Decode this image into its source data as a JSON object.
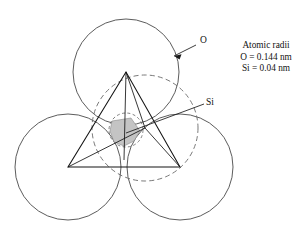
{
  "figure": {
    "name": "silicate-tetrahedron",
    "background_color": "#ffffff",
    "width": 308,
    "height": 231
  },
  "labels": {
    "oxygen": {
      "text": "O",
      "x": 200,
      "y": 43
    },
    "silicon": {
      "text": "Si",
      "x": 206,
      "y": 105
    }
  },
  "annotation": {
    "title": "Atomic radii",
    "oxygen_radius": "O = 0.144 nm",
    "silicon_radius": "Si = 0.04 nm"
  },
  "colors": {
    "sphere_stroke": "#4a4a4a",
    "hidden_sphere_stroke": "#6a6a6a",
    "edge_stroke": "#141414",
    "silicon_shade": "#c4c4c4",
    "text": "#111111",
    "background": "#ffffff"
  },
  "geometry": {
    "oxygen_radius_px": 53,
    "silicon_radius_px": 17,
    "spheres": [
      {
        "name": "oxygen-top",
        "cx": 126,
        "cy": 72,
        "r": 53,
        "hidden": false
      },
      {
        "name": "oxygen-bottom-left",
        "cx": 68,
        "cy": 167,
        "r": 53,
        "hidden": false
      },
      {
        "name": "oxygen-bottom-right",
        "cx": 180,
        "cy": 167,
        "r": 53,
        "hidden": false
      },
      {
        "name": "oxygen-back",
        "cx": 145,
        "cy": 128,
        "r": 53,
        "hidden": true
      }
    ],
    "silicon_sphere": {
      "cx": 126,
      "cy": 130,
      "r": 17
    },
    "vertices": {
      "apex": {
        "x": 126,
        "y": 72
      },
      "bottom_left": {
        "x": 68,
        "y": 167
      },
      "bottom_right": {
        "x": 180,
        "y": 167
      },
      "back": {
        "x": 145,
        "y": 128
      }
    }
  }
}
